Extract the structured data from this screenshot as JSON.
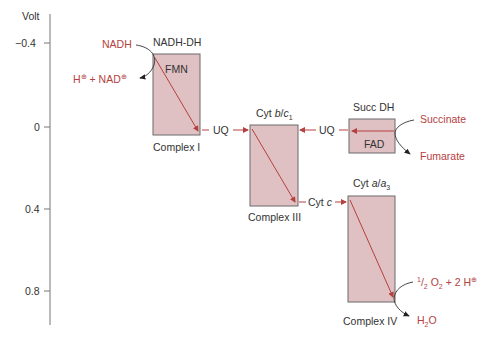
{
  "axis": {
    "label": "Volt",
    "ticks": [
      {
        "label": "−0.4",
        "value": -0.4
      },
      {
        "label": "0",
        "value": 0
      },
      {
        "label": "0.4",
        "value": 0.4
      },
      {
        "label": "0.8",
        "value": 0.8
      }
    ]
  },
  "complexes": {
    "c1": {
      "name": "Complex I",
      "enzyme": "NADH-DH",
      "cofactor": "FMN"
    },
    "c3": {
      "name": "Complex III",
      "enzyme_prefix": "Cyt ",
      "enzyme_b": "b",
      "enzyme_sep": "/",
      "enzyme_c": "c",
      "enzyme_sub": "1"
    },
    "c2": {
      "enzyme": "Succ DH",
      "cofactor": "FAD"
    },
    "c4": {
      "name": "Complex IV",
      "enzyme_prefix": "Cyt ",
      "enzyme_a": "a",
      "enzyme_sep": "/",
      "enzyme_a3": "a",
      "enzyme_sub": "3"
    }
  },
  "carriers": {
    "uq1": "UQ",
    "uq2": "UQ",
    "cytc_prefix": "Cyt ",
    "cytc_italic": "c"
  },
  "substrates": {
    "nadh": "NADH",
    "h_plus": "H",
    "plus_sign": "⊕",
    "plus_nad": " + NAD",
    "succinate": "Succinate",
    "fumarate": "Fumarate",
    "half": "1",
    "half_den": "2",
    "o2": " O",
    "o2_sub": "2",
    "two_h": " + 2 H",
    "h2o_h": "H",
    "h2o_sub": "2",
    "h2o_o": "O"
  },
  "colors": {
    "box_fill": "#dfc0c3",
    "box_stroke": "#6b6b6b",
    "red": "#b5413f",
    "axis": "#777777"
  }
}
